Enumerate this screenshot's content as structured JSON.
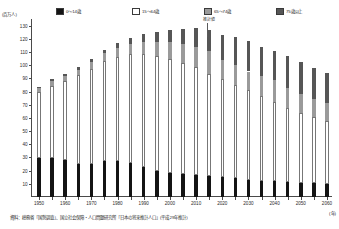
{
  "chart_data": {
    "type": "bar",
    "title": "",
    "subtitle": "",
    "ylabel": "(百万人)",
    "xlabel": "(年)",
    "ylim": [
      0,
      135
    ],
    "ytick_values": [
      10,
      20,
      30,
      40,
      50,
      60,
      70,
      80,
      90,
      100,
      110,
      120,
      130
    ],
    "ytick_labels": [
      "10",
      "20",
      "30",
      "40",
      "50",
      "60",
      "70",
      "80",
      "90",
      "100",
      "110",
      "120",
      "130"
    ],
    "grid": false,
    "stacked": true,
    "legend_position": "top",
    "categories": [
      "1950",
      "1955",
      "1960",
      "1965",
      "1970",
      "1975",
      "1980",
      "1985",
      "1990",
      "1995",
      "2000",
      "2005",
      "2010",
      "2015",
      "2020",
      "2025",
      "2030",
      "2035",
      "2040",
      "2045",
      "2050",
      "2055",
      "2060"
    ],
    "xtick_labels": [
      "1950",
      "1960",
      "1970",
      "1980",
      "1990",
      "2000",
      "2010",
      "2020",
      "2030",
      "2040",
      "2050",
      "2060"
    ],
    "series": [
      {
        "name": "0〜14歳",
        "color": "#141414",
        "values": [
          29.4,
          29.8,
          28.1,
          25.2,
          25.2,
          27.2,
          27.5,
          26.0,
          22.5,
          20.0,
          18.5,
          17.6,
          16.8,
          15.9,
          15.1,
          14.1,
          13.2,
          12.5,
          11.9,
          11.4,
          10.8,
          10.3,
          9.8
        ]
      },
      {
        "name": "15〜64歳",
        "color": "#ffffff",
        "values": [
          50.0,
          54.7,
          60.0,
          67.0,
          72.1,
          75.8,
          78.8,
          82.5,
          86.1,
          87.2,
          86.2,
          84.4,
          81.7,
          77.3,
          74.1,
          71.0,
          67.7,
          64.2,
          59.8,
          55.8,
          52.8,
          50.3,
          47.9
        ]
      },
      {
        "name": "65〜74歳",
        "color": "#9a9a9a",
        "values": [
          3.1,
          3.4,
          3.8,
          4.3,
          5.1,
          6.0,
          6.7,
          7.7,
          8.9,
          10.7,
          12.9,
          14.1,
          15.2,
          17.5,
          14.9,
          14.7,
          14.3,
          14.9,
          16.8,
          15.8,
          14.2,
          13.4,
          13.3
        ]
      },
      {
        "name": "75歳以上",
        "color": "#565656",
        "values": [
          1.1,
          1.3,
          1.6,
          1.9,
          2.2,
          2.8,
          3.7,
          4.7,
          6.0,
          7.2,
          9.0,
          11.6,
          14.2,
          16.3,
          18.7,
          21.8,
          22.8,
          22.5,
          22.4,
          23.9,
          24.5,
          24.0,
          23.4
        ]
      }
    ],
    "annotation": {
      "label": "推計値",
      "at_category": "2015",
      "note": "forecast boundary marker"
    },
    "legend": [
      {
        "label": "0〜14歳",
        "swatch": "#141414"
      },
      {
        "label": "15〜64歳",
        "swatch": "#ffffff"
      },
      {
        "label": "65〜74歳",
        "swatch": "#9a9a9a"
      },
      {
        "label": "75歳以上",
        "swatch": "#565656"
      }
    ],
    "source": "資料：総務省「国勢調査」、国立社会保障・人口問題研究所「日本の将来推計人口」(平成29年推計)"
  }
}
